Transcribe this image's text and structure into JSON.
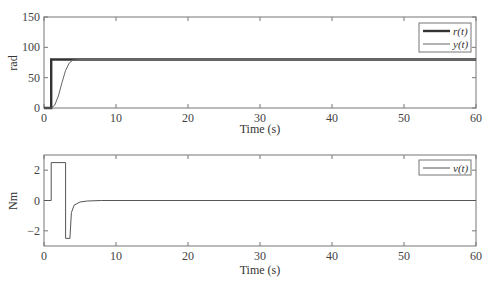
{
  "chart_data": [
    {
      "type": "line",
      "title": "",
      "xlabel": "Time (s)",
      "ylabel": "rad",
      "xlim": [
        0,
        60
      ],
      "ylim": [
        0,
        150
      ],
      "xticks": [
        0,
        10,
        20,
        30,
        40,
        50,
        60
      ],
      "yticks": [
        0,
        50,
        100,
        150
      ],
      "grid": false,
      "legend_position": "upper right",
      "series": [
        {
          "name": "r(t)",
          "style": "thick",
          "x": [
            0,
            1,
            1,
            60
          ],
          "y": [
            0,
            0,
            80,
            80
          ]
        },
        {
          "name": "y(t)",
          "style": "thin",
          "x": [
            0,
            1,
            1.5,
            2,
            2.5,
            3,
            3.5,
            4,
            5,
            60
          ],
          "y": [
            0,
            0,
            5,
            20,
            42,
            62,
            74,
            79,
            80,
            80
          ]
        }
      ]
    },
    {
      "type": "line",
      "title": "",
      "xlabel": "Time (s)",
      "ylabel": "Nm",
      "xlim": [
        0,
        60
      ],
      "ylim": [
        -3,
        3
      ],
      "xticks": [
        0,
        10,
        20,
        30,
        40,
        50,
        60
      ],
      "yticks": [
        -2,
        0,
        2
      ],
      "grid": false,
      "legend_position": "upper right",
      "series": [
        {
          "name": "v(t)",
          "style": "thin",
          "x": [
            0,
            1,
            1,
            3,
            3,
            3.6,
            3.8,
            4.2,
            5,
            6,
            8,
            60
          ],
          "y": [
            0,
            0,
            2.5,
            2.5,
            -2.5,
            -2.5,
            -0.8,
            -0.3,
            -0.1,
            -0.03,
            0,
            0
          ]
        }
      ]
    }
  ],
  "labels": {
    "top_xlabel": "Time (s)",
    "top_ylabel": "rad",
    "bottom_xlabel": "Time (s)",
    "bottom_ylabel": "Nm",
    "legend_r": "r(t)",
    "legend_y": "y(t)",
    "legend_v": "v(t)"
  }
}
